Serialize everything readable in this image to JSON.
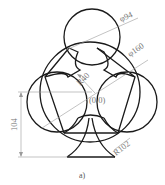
{
  "drawing": {
    "caption": "a)",
    "origin_label": "(0.0)",
    "dimensions": {
      "top_circle_diameter": "φ94",
      "big_circle_diameter": "φ160",
      "inner_radius": "R40",
      "stem_radius": "R102",
      "height": "104"
    },
    "colors": {
      "outline": "#1a1a1a",
      "dimension": "#9a9a9a",
      "background": "#ffffff"
    }
  }
}
